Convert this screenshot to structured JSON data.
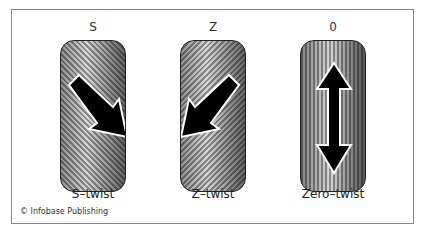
{
  "figure": {
    "panels": [
      {
        "id": "s",
        "top_label": "S",
        "bottom_label": "S–twist",
        "arrow_direction": "down-right",
        "stripe_direction": "diagonal-up-right"
      },
      {
        "id": "z",
        "top_label": "Z",
        "bottom_label": "Z–twist",
        "arrow_direction": "down-left",
        "stripe_direction": "diagonal-up-left"
      },
      {
        "id": "zero",
        "top_label": "0",
        "bottom_label": "Zero–twist",
        "arrow_direction": "vertical-double",
        "stripe_direction": "vertical"
      }
    ],
    "credit": "© Infobase Publishing",
    "colors": {
      "border": "#222222",
      "arrow": "#000000",
      "arrow_outline": "#ffffff",
      "frame": "#888888"
    }
  }
}
